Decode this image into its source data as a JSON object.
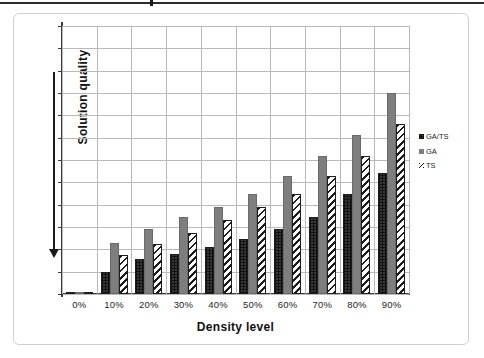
{
  "figure": {
    "frame_visible": true,
    "background": "#ffffff"
  },
  "axis": {
    "y_title": "Solution quality",
    "x_title": "Density level",
    "y_arrow_direction": "down"
  },
  "legend": {
    "position": "right",
    "entries": [
      {
        "label": "GA/TS",
        "icon": "square-crosshatch-swatch",
        "color": "#3a3a3a"
      },
      {
        "label": "GA",
        "icon": "square-solid-swatch",
        "color": "#7e7e7e"
      },
      {
        "label": "TS",
        "icon": "square-diagonal-swatch",
        "color": "#1b1b1b"
      }
    ]
  },
  "chart_data": {
    "type": "bar",
    "title": "",
    "xlabel": "Density level",
    "ylabel": "Solution quality",
    "categories": [
      "0%",
      "10%",
      "20%",
      "30%",
      "40%",
      "50%",
      "60%",
      "70%",
      "80%",
      "90%"
    ],
    "ylim": [
      0,
      12
    ],
    "y_gridlines": 12,
    "y_ticklabels": [],
    "grid": true,
    "legend_position": "right",
    "series": [
      {
        "name": "GA/TS",
        "color": "#3a3a3a",
        "pattern": "crosshatch",
        "values": [
          0.1,
          1.0,
          1.55,
          1.8,
          2.1,
          2.45,
          2.9,
          3.45,
          4.5,
          5.4
        ]
      },
      {
        "name": "GA",
        "color": "#7e7e7e",
        "pattern": "solid",
        "values": [
          0.1,
          2.3,
          2.9,
          3.45,
          3.9,
          4.5,
          5.3,
          6.2,
          7.1,
          9.0
        ]
      },
      {
        "name": "TS",
        "color": "#1b1b1b",
        "pattern": "diagonal-stripe",
        "values": [
          0.1,
          1.75,
          2.25,
          2.75,
          3.3,
          3.9,
          4.5,
          5.3,
          6.2,
          7.6
        ]
      }
    ]
  }
}
